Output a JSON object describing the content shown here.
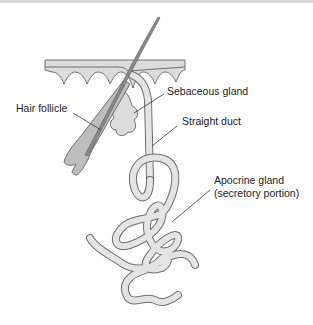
{
  "figure": {
    "labels": {
      "hair_follicle": "Hair follicle",
      "sebaceous_gland": "Sebaceous gland",
      "straight_duct": "Straight duct",
      "apocrine_gland_line1": "Apocrine gland",
      "apocrine_gland_line2": "(secretory portion)"
    },
    "colors": {
      "tissue_fill": "#dcdcdc",
      "outline": "#6e6e6e",
      "hair_fill": "#8a8a8a",
      "follicle_fill": "#bdbdbd",
      "leader_line": "#333333"
    }
  }
}
